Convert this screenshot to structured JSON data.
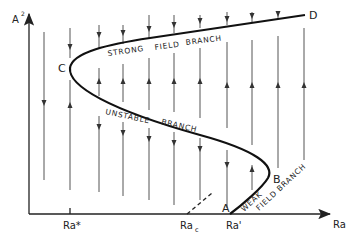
{
  "figure": {
    "y_axis_label": "A",
    "y_axis_superscript": "2",
    "x_axis_label": "Ra",
    "ticks": {
      "ra_star": "Ra*",
      "ra_c": "Ra",
      "ra_c_sub": "c",
      "ra_prime": "Ra'"
    },
    "points": {
      "A": "A",
      "B": "B",
      "C": "C",
      "D": "D"
    },
    "branches": {
      "strong_1": "STRONG",
      "strong_2": "FIELD",
      "strong_3": "BRANCH",
      "unstable_1": "UNSTABLE",
      "unstable_2": "BRANCH",
      "weak_1": "WEAK",
      "weak_2": "FIELD BRANCH"
    },
    "colors": {
      "ink": "#222222",
      "flow_lines": "#555555",
      "background": "#ffffff"
    }
  }
}
